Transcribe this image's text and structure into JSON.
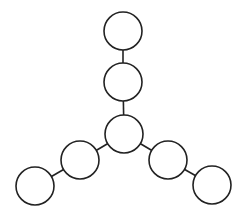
{
  "diagram": {
    "type": "tree-graph",
    "colors": {
      "stroke": "#222222",
      "fill": "#ffffff",
      "background": "#ffffff"
    },
    "node_radius": 19,
    "nodes": [
      {
        "id": "top",
        "cx": 123,
        "cy": 31
      },
      {
        "id": "upper",
        "cx": 123,
        "cy": 82
      },
      {
        "id": "center",
        "cx": 124,
        "cy": 134
      },
      {
        "id": "left-mid",
        "cx": 80,
        "cy": 160
      },
      {
        "id": "left-end",
        "cx": 35,
        "cy": 186
      },
      {
        "id": "right-mid",
        "cx": 168,
        "cy": 160
      },
      {
        "id": "right-end",
        "cx": 212,
        "cy": 185
      }
    ],
    "edges": [
      [
        "top",
        "upper"
      ],
      [
        "upper",
        "center"
      ],
      [
        "center",
        "left-mid"
      ],
      [
        "left-mid",
        "left-end"
      ],
      [
        "center",
        "right-mid"
      ],
      [
        "right-mid",
        "right-end"
      ]
    ]
  }
}
